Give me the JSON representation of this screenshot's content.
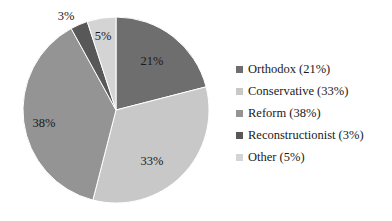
{
  "chart_data": {
    "type": "pie",
    "title": "",
    "subtitle": "",
    "xlabel": "",
    "ylabel": "",
    "grid": false,
    "legend_position": "right",
    "start_angle_deg": 0,
    "direction": "clockwise",
    "categories": [
      "Orthodox",
      "Conservative",
      "Reform",
      "Reconstructionist",
      "Other"
    ],
    "values": [
      21,
      33,
      38,
      3,
      5
    ],
    "units": "percent",
    "total": 100,
    "data_labels": [
      "21%",
      "33%",
      "38%",
      "3%",
      "5%"
    ],
    "colors": [
      "#6e6e6e",
      "#c8c8c8",
      "#949494",
      "#585858",
      "#d4d4d4"
    ],
    "slices": [
      {
        "name": "Orthodox",
        "value": 21,
        "label": "21%",
        "legend_label": "Orthodox (21%)",
        "color": "#6e6e6e",
        "start_deg": 0,
        "end_deg": 75.6,
        "label_position": "inside",
        "label_x": 152,
        "label_y": 62
      },
      {
        "name": "Conservative",
        "value": 33,
        "label": "33%",
        "legend_label": "Conservative (33%)",
        "color": "#c8c8c8",
        "start_deg": 75.6,
        "end_deg": 194.4,
        "label_position": "inside",
        "label_x": 152,
        "label_y": 162
      },
      {
        "name": "Reform",
        "value": 38,
        "label": "38%",
        "legend_label": "Reform (38%)",
        "color": "#949494",
        "start_deg": 194.4,
        "end_deg": 331.2,
        "label_position": "inside",
        "label_x": 44,
        "label_y": 124
      },
      {
        "name": "Reconstructionist",
        "value": 3,
        "label": "3%",
        "legend_label": "Reconstructionist (3%)",
        "color": "#585858",
        "start_deg": 331.2,
        "end_deg": 342.0,
        "label_position": "outside",
        "label_x": 66,
        "label_y": 17
      },
      {
        "name": "Other",
        "value": 5,
        "label": "5%",
        "legend_label": "Other (5%)",
        "color": "#d4d4d4",
        "start_deg": 342.0,
        "end_deg": 360.0,
        "label_position": "inside",
        "label_x": 103,
        "label_y": 37
      }
    ],
    "geometry": {
      "center_x": 116,
      "center_y": 110,
      "radius": 93
    }
  },
  "legend": {
    "items": [
      {
        "label": "Orthodox (21%)",
        "color": "#6e6e6e"
      },
      {
        "label": "Conservative (33%)",
        "color": "#c8c8c8"
      },
      {
        "label": "Reform (38%)",
        "color": "#949494"
      },
      {
        "label": "Reconstructionist (3%)",
        "color": "#585858"
      },
      {
        "label": "Other (5%)",
        "color": "#d4d4d4"
      }
    ]
  },
  "labels": {
    "orthodox_pct": "21%",
    "conservative_pct": "33%",
    "reform_pct": "38%",
    "reconstructionist_pct": "3%",
    "other_pct": "5%"
  }
}
